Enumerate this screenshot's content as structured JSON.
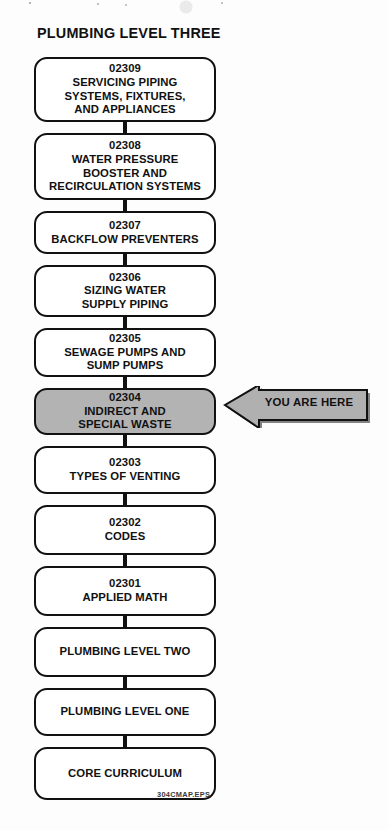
{
  "title": "PLUMBING LEVEL THREE",
  "colors": {
    "highlight_fill": "#b3b3b3",
    "arrow_fill": "#b0b0b0",
    "outline": "#111111",
    "page_background": "#ffffff"
  },
  "annotation": {
    "label": "YOU ARE HERE",
    "points_to": "02304"
  },
  "footer": {
    "code": "304CMAP.EPS"
  },
  "flowchart": {
    "orientation": "vertical-descending",
    "nodes": [
      {
        "code": "02309",
        "lines": [
          "SERVICING PIPING",
          "SYSTEMS, FIXTURES,",
          "AND APPLIANCES"
        ],
        "highlighted": false
      },
      {
        "code": "02308",
        "lines": [
          "WATER PRESSURE",
          "BOOSTER AND",
          "RECIRCULATION SYSTEMS"
        ],
        "highlighted": false
      },
      {
        "code": "02307",
        "lines": [
          "BACKFLOW PREVENTERS"
        ],
        "highlighted": false
      },
      {
        "code": "02306",
        "lines": [
          "SIZING WATER",
          "SUPPLY PIPING"
        ],
        "highlighted": false
      },
      {
        "code": "02305",
        "lines": [
          "SEWAGE PUMPS AND",
          "SUMP PUMPS"
        ],
        "highlighted": false
      },
      {
        "code": "02304",
        "lines": [
          "INDIRECT AND",
          "SPECIAL WASTE"
        ],
        "highlighted": true
      },
      {
        "code": "02303",
        "lines": [
          "TYPES OF VENTING"
        ],
        "highlighted": false
      },
      {
        "code": "02302",
        "lines": [
          "CODES"
        ],
        "highlighted": false
      },
      {
        "code": "02301",
        "lines": [
          "APPLIED MATH"
        ],
        "highlighted": false
      },
      {
        "code": "",
        "lines": [
          "PLUMBING LEVEL TWO"
        ],
        "highlighted": false
      },
      {
        "code": "",
        "lines": [
          "PLUMBING LEVEL ONE"
        ],
        "highlighted": false
      },
      {
        "code": "",
        "lines": [
          "CORE CURRICULUM"
        ],
        "highlighted": false
      }
    ]
  }
}
